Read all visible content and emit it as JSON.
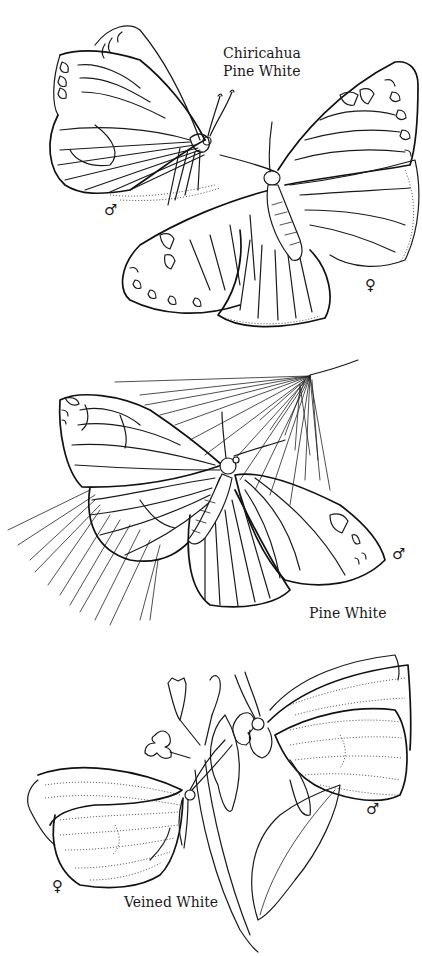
{
  "illustration": {
    "background": "#ffffff",
    "ink_color": "#1a1a1a",
    "sections": [
      {
        "id": "chiricahua-pine-white",
        "title_lines": [
          "Chiricahua",
          "Pine White"
        ],
        "specimens": [
          {
            "sex": "male",
            "symbol": "♂"
          },
          {
            "sex": "female",
            "symbol": "♀"
          }
        ]
      },
      {
        "id": "pine-white",
        "title": "Pine White",
        "specimens": [
          {
            "sex": "male",
            "symbol": "♂"
          }
        ]
      },
      {
        "id": "veined-white",
        "title": "Veined White",
        "specimens": [
          {
            "sex": "male",
            "symbol": "♂"
          },
          {
            "sex": "female",
            "symbol": "♀"
          }
        ]
      }
    ]
  }
}
